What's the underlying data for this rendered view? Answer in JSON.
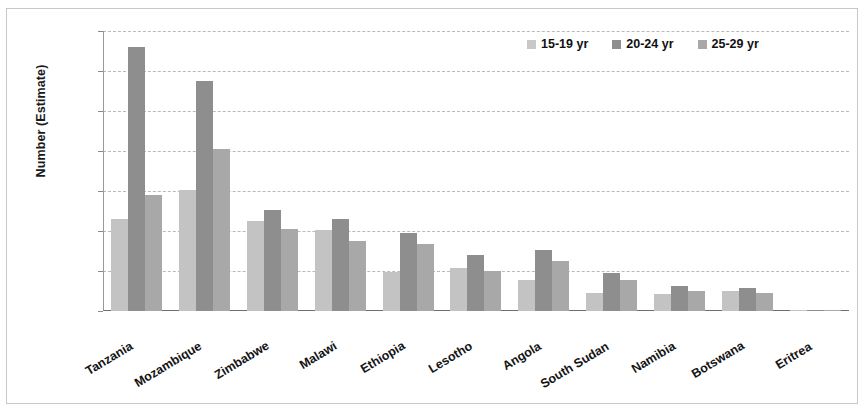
{
  "chart_data": {
    "type": "bar",
    "title": "",
    "xlabel": "",
    "ylabel": "Number (Estimate)",
    "ylim": [
      0,
      14000
    ],
    "yticks": [
      0,
      2000,
      4000,
      6000,
      8000,
      10000,
      12000,
      14000
    ],
    "ytick_labels": [
      "0",
      "2 000",
      "4 000",
      "6 000",
      "8 000",
      "10 000",
      "12 000",
      "14 000"
    ],
    "grid": true,
    "legend_position": "top-right",
    "categories": [
      "Tanzania",
      "Mozambique",
      "Zimbabwe",
      "Malawi",
      "Ethiopia",
      "Lesotho",
      "Angola",
      "South Sudan",
      "Namibia",
      "Botswana",
      "Eritrea"
    ],
    "series": [
      {
        "name": "15-19 yr",
        "color": "#c3c3c3",
        "values": [
          4600,
          6050,
          4500,
          4050,
          1950,
          2150,
          1550,
          900,
          850,
          1000,
          30
        ]
      },
      {
        "name": "20-24 yr",
        "color": "#8e8e8e",
        "values": [
          13200,
          11500,
          5050,
          4600,
          3900,
          2800,
          3050,
          1900,
          1250,
          1150,
          60
        ]
      },
      {
        "name": "25-29 yr",
        "color": "#a8a8a8",
        "values": [
          5800,
          8100,
          4100,
          3500,
          3350,
          2000,
          2500,
          1550,
          1000,
          900,
          55
        ]
      }
    ]
  },
  "legend": {
    "items": [
      {
        "label": "15-19 yr",
        "swatch": "legend-swatch-15-19"
      },
      {
        "label": "20-24 yr",
        "swatch": "legend-swatch-20-24"
      },
      {
        "label": "25-29 yr",
        "swatch": "legend-swatch-25-29"
      }
    ]
  },
  "axis": {
    "y_title": "Number (Estimate)"
  }
}
